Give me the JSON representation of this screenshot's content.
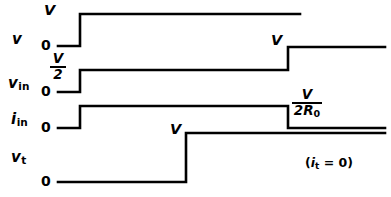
{
  "figure": {
    "width": 391,
    "height": 197,
    "line_color": "#000000",
    "background_color": "#ffffff",
    "stroke_width": 2.6
  },
  "rows": [
    {
      "id": "v",
      "name": "v",
      "subscript": "",
      "zero_label": "0",
      "high_label": "V"
    },
    {
      "id": "v-in",
      "name": "v",
      "subscript": "in",
      "zero_label": "0",
      "level1_num": "V",
      "level1_den": "2",
      "level2_label": "V"
    },
    {
      "id": "i-in",
      "name": "i",
      "subscript": "in",
      "zero_label": "0",
      "level2_num": "V",
      "level2_den_text": "2R",
      "level2_den_sub": "0"
    },
    {
      "id": "v-t",
      "name": "v",
      "subscript": "t",
      "zero_label": "0",
      "high_label": "V",
      "note_open": "(",
      "note_var": "i",
      "note_sub": "t",
      "note_eq": " = 0",
      "note_close": ")"
    }
  ],
  "chart_data": {
    "type": "line",
    "xlabel": "",
    "ylabel": "",
    "grid": false,
    "legend": "none",
    "series": [
      {
        "name": "v",
        "label": "v",
        "annotations": [
          "V",
          "0"
        ],
        "points": [
          {
            "x": 58,
            "y": 46
          },
          {
            "x": 80,
            "y": 46
          },
          {
            "x": 80,
            "y": 14
          },
          {
            "x": 300,
            "y": 14
          }
        ]
      },
      {
        "name": "v_in",
        "label": "v_in",
        "annotations": [
          "V/2",
          "0",
          "V"
        ],
        "points": [
          {
            "x": 58,
            "y": 92
          },
          {
            "x": 80,
            "y": 92
          },
          {
            "x": 80,
            "y": 70
          },
          {
            "x": 288,
            "y": 70
          },
          {
            "x": 288,
            "y": 47
          },
          {
            "x": 385,
            "y": 47
          }
        ]
      },
      {
        "name": "i_in",
        "label": "i_in",
        "annotations": [
          "0",
          "V/2R0"
        ],
        "points": [
          {
            "x": 58,
            "y": 128
          },
          {
            "x": 80,
            "y": 128
          },
          {
            "x": 80,
            "y": 106
          },
          {
            "x": 288,
            "y": 106
          },
          {
            "x": 288,
            "y": 128
          },
          {
            "x": 385,
            "y": 128
          }
        ]
      },
      {
        "name": "v_t",
        "label": "v_t",
        "annotations": [
          "V",
          "0",
          "(i_t = 0)"
        ],
        "points": [
          {
            "x": 58,
            "y": 182
          },
          {
            "x": 186,
            "y": 182
          },
          {
            "x": 186,
            "y": 133
          },
          {
            "x": 385,
            "y": 133
          }
        ]
      }
    ]
  }
}
